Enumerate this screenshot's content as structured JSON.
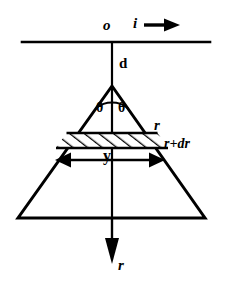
{
  "figure": {
    "stroke_color": "#000000",
    "background_color": "#ffffff",
    "labels": {
      "origin": "o",
      "current": "i",
      "distance": "d",
      "angle_left": "θ",
      "angle_right": "θ",
      "radius": "r",
      "radius_plus": "r+dr",
      "halfwidth": "y",
      "radial_axis": "r"
    },
    "elements": {
      "wire_line": "horizontal-wire",
      "current_arrow": "current-direction-arrow",
      "axis_line": "vertical-axis",
      "triangle": "field-cone-triangle",
      "angle_arc": "apex-angle-arc",
      "band": "hatched-annulus-band",
      "y_arrow": "y-dimension-double-arrow",
      "r_arrow": "radial-direction-arrow"
    },
    "geometry": {
      "wire_y": 42,
      "wire_x_start": 22,
      "wire_x_end": 210,
      "apex_x": 112,
      "apex_y": 86,
      "base_y": 218,
      "base_x_left": 18,
      "base_x_right": 205,
      "band_top_y": 133,
      "band_bottom_y": 148,
      "y_arrow_y": 160,
      "y_arrow_x_left": 57,
      "y_arrow_x_right": 163,
      "r_arrow_tip_y": 262
    }
  }
}
